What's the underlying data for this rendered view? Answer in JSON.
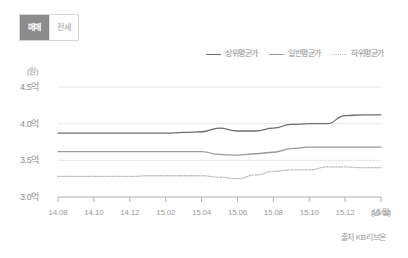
{
  "tabs": [
    {
      "label": "매매",
      "active": true
    },
    {
      "label": "전세",
      "active": false
    }
  ],
  "axis": {
    "unit_label": "(원)",
    "x_unit_label": "(년/월)"
  },
  "source": "출처 KB리브온",
  "colors": {
    "top_series": "#6e6e6e",
    "mid_series": "#9a9a9a",
    "low_series": "#bdbdbd",
    "grid": "#e6e6e6",
    "axis": "#b0b0b0",
    "tab_active_bg": "#8c8c8c",
    "tab_inactive_bg": "#ffffff",
    "text": "#8d8d8d"
  },
  "chart_data": {
    "type": "line",
    "title": "",
    "xlabel": "(년/월)",
    "ylabel": "(원)",
    "ylim": [
      3.0,
      4.5
    ],
    "ytick_labels": [
      "4.5억",
      "4.0억",
      "3.5억",
      "3.0억"
    ],
    "ytick_values": [
      4.5,
      4.0,
      3.5,
      3.0
    ],
    "grid": true,
    "legend_position": "top-right",
    "x": [
      "14.08",
      "14.09",
      "14.10",
      "14.11",
      "14.12",
      "15.01",
      "15.02",
      "15.03",
      "15.04",
      "15.05",
      "15.06",
      "15.07",
      "15.08",
      "15.09",
      "15.10",
      "15.11",
      "15.12",
      "16.01",
      "16.02"
    ],
    "xtick_labels": [
      "14.08",
      "14.10",
      "14.12",
      "15.02",
      "15.04",
      "15.06",
      "15.08",
      "15.10",
      "15.12",
      "16.02"
    ],
    "series": [
      {
        "name": "상위평균가",
        "style": "solid",
        "color": "#6e6e6e",
        "values": [
          3.87,
          3.87,
          3.87,
          3.87,
          3.87,
          3.87,
          3.87,
          3.88,
          3.89,
          3.94,
          3.9,
          3.9,
          3.94,
          3.99,
          4.0,
          4.0,
          4.11,
          4.12,
          4.12
        ]
      },
      {
        "name": "일반평균가",
        "style": "solid",
        "color": "#9a9a9a",
        "values": [
          3.62,
          3.62,
          3.62,
          3.62,
          3.62,
          3.62,
          3.62,
          3.62,
          3.62,
          3.58,
          3.57,
          3.59,
          3.61,
          3.66,
          3.68,
          3.68,
          3.68,
          3.68,
          3.68
        ]
      },
      {
        "name": "하위평균가",
        "style": "dotted",
        "color": "#bdbdbd",
        "values": [
          3.28,
          3.28,
          3.28,
          3.28,
          3.28,
          3.29,
          3.29,
          3.29,
          3.29,
          3.27,
          3.25,
          3.3,
          3.35,
          3.37,
          3.37,
          3.41,
          3.41,
          3.4,
          3.4
        ]
      }
    ]
  }
}
